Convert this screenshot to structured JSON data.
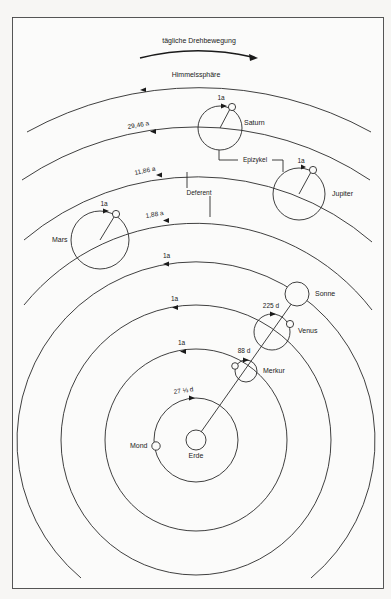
{
  "header": {
    "daily_rotation_label": "tägliche Drehbewegung",
    "celestial_sphere_label": "Himmelssphäre"
  },
  "annotations": {
    "epicycle_label": "Epizykel",
    "deferent_label": "Deferent"
  },
  "center": {
    "name": "Erde",
    "x": 196,
    "y": 440,
    "r": 10
  },
  "bodies": [
    {
      "id": "mond",
      "name": "Mond",
      "deferent_r": 42,
      "deferent_period": "27 ⅓ d"
    },
    {
      "id": "merkur",
      "name": "Merkur",
      "deferent_r": 91,
      "deferent_period": "1a",
      "epicycle_period": "88 d"
    },
    {
      "id": "venus",
      "name": "Venus",
      "deferent_r": 135,
      "deferent_period": "1a",
      "epicycle_period": "225 d"
    },
    {
      "id": "sonne",
      "name": "Sonne",
      "deferent_r": 179,
      "deferent_period": "1a"
    },
    {
      "id": "mars",
      "name": "Mars",
      "deferent_r": 222,
      "deferent_period": "1,88 a",
      "epicycle_period": "1a"
    },
    {
      "id": "jupiter",
      "name": "Jupiter",
      "deferent_r": 268,
      "deferent_period": "11,86 a",
      "epicycle_period": "1a"
    },
    {
      "id": "saturn",
      "name": "Saturn",
      "deferent_r": 312,
      "deferent_period": "29,46 a",
      "epicycle_period": "1a"
    }
  ],
  "celestial_sphere_r": 356,
  "colors": {
    "ink": "#2a2a2a",
    "paper": "#f7f6f4"
  }
}
